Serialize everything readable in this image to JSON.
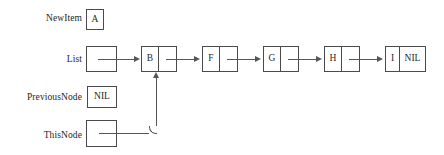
{
  "diagram": {
    "line_color": "#555555",
    "border_color": "#4a4a4a",
    "background": "#ffffff"
  },
  "variables": [
    {
      "id": "newitem",
      "label": "NewItem",
      "value": "A"
    },
    {
      "id": "list",
      "label": "List",
      "value": ""
    },
    {
      "id": "previousnode",
      "label": "PreviousNode",
      "value": "NIL"
    },
    {
      "id": "thisnode",
      "label": "ThisNode",
      "value": ""
    }
  ],
  "list_nodes": [
    {
      "id": "node-b",
      "data": "B",
      "next": ""
    },
    {
      "id": "node-f",
      "data": "F",
      "next": ""
    },
    {
      "id": "node-g",
      "data": "G",
      "next": ""
    },
    {
      "id": "node-h",
      "data": "H",
      "next": ""
    },
    {
      "id": "node-i",
      "data": "I",
      "next": "NIL"
    }
  ],
  "pointers": [
    {
      "id": "list-to-b",
      "from": "List",
      "to": "node-b"
    },
    {
      "id": "b-to-f",
      "from": "node-b",
      "to": "node-f"
    },
    {
      "id": "f-to-g",
      "from": "node-f",
      "to": "node-g"
    },
    {
      "id": "g-to-h",
      "from": "node-g",
      "to": "node-h"
    },
    {
      "id": "h-to-i",
      "from": "node-h",
      "to": "node-i"
    },
    {
      "id": "thisnode-to-b",
      "from": "ThisNode",
      "to": "node-b"
    }
  ]
}
